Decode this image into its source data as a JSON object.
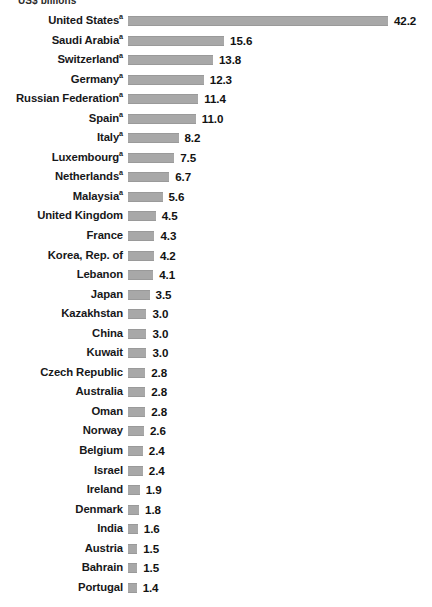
{
  "chart_data": {
    "type": "bar",
    "title": "",
    "subtitle": "",
    "unit_caption": "US$ billions",
    "xlabel": "",
    "ylabel": "",
    "orientation": "horizontal",
    "grid": false,
    "legend": null,
    "xlim": [
      0,
      42.2
    ],
    "categories": [
      "United States",
      "Saudi Arabia",
      "Switzerland",
      "Germany",
      "Russian Federation",
      "Spain",
      "Italy",
      "Luxembourg",
      "Netherlands",
      "Malaysia",
      "United Kingdom",
      "France",
      "Korea, Rep. of",
      "Lebanon",
      "Japan",
      "Kazakhstan",
      "China",
      "Kuwait",
      "Czech Republic",
      "Australia",
      "Oman",
      "Norway",
      "Belgium",
      "Israel",
      "Ireland",
      "Denmark",
      "India",
      "Austria",
      "Bahrain",
      "Portugal"
    ],
    "values": [
      42.2,
      15.6,
      13.8,
      12.3,
      11.4,
      11.0,
      8.2,
      7.5,
      6.7,
      5.6,
      4.5,
      4.3,
      4.2,
      4.1,
      3.5,
      3.0,
      3.0,
      3.0,
      2.8,
      2.8,
      2.8,
      2.6,
      2.4,
      2.4,
      1.9,
      1.8,
      1.6,
      1.5,
      1.5,
      1.4
    ],
    "value_labels": [
      "42.2",
      "15.6",
      "13.8",
      "12.3",
      "11.4",
      "11.0",
      "8.2",
      "7.5",
      "6.7",
      "5.6",
      "4.5",
      "4.3",
      "4.2",
      "4.1",
      "3.5",
      "3.0",
      "3.0",
      "3.0",
      "2.8",
      "2.8",
      "2.8",
      "2.6",
      "2.4",
      "2.4",
      "1.9",
      "1.8",
      "1.6",
      "1.5",
      "1.5",
      "1.4"
    ],
    "footnote_marker": "a",
    "footnote_marked_categories": [
      "United States",
      "Saudi Arabia",
      "Switzerland",
      "Germany",
      "Russian Federation",
      "Spain",
      "Italy",
      "Luxembourg",
      "Netherlands",
      "Malaysia"
    ],
    "colors": {
      "bar": "#a8a8a8",
      "bar_edge": "#9a9a9a",
      "label_text": "#17181a",
      "value_text": "#121212",
      "background": "#ffffff"
    }
  }
}
